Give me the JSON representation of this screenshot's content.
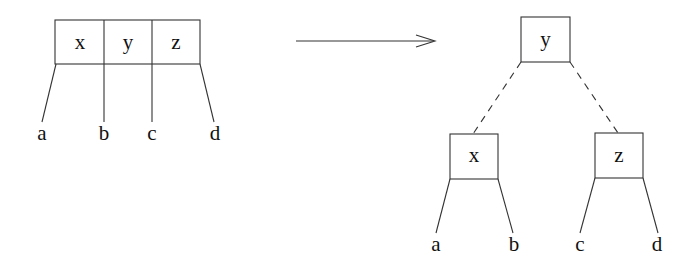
{
  "diagram": {
    "type": "tree-transformation",
    "before": {
      "node_keys": [
        "x",
        "y",
        "z"
      ],
      "children": [
        "a",
        "b",
        "c",
        "d"
      ]
    },
    "arrow": {
      "direction": "right"
    },
    "after": {
      "root": "y",
      "left": {
        "key": "x",
        "children": [
          "a",
          "b"
        ]
      },
      "right": {
        "key": "z",
        "children": [
          "c",
          "d"
        ]
      },
      "root_edges_style": "dashed"
    }
  }
}
